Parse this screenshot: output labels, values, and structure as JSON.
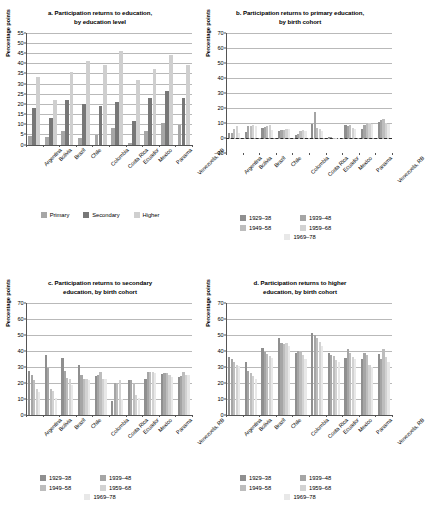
{
  "figure": {
    "ylabel": "Percentage points"
  },
  "panels": [
    {
      "id": "a",
      "title_line1": "a. Participation returns to education,",
      "title_line2": "by education level"
    },
    {
      "id": "b",
      "title_line1": "b. Participation returns to primary education,",
      "title_line2": "by birth cohort"
    },
    {
      "id": "c",
      "title_line1": "c. Participation returns to secondary",
      "title_line2": "education, by birth cohort"
    },
    {
      "id": "d",
      "title_line1": "d. Participation returns to higher",
      "title_line2": "education, by birth cohort"
    }
  ],
  "legend_education": {
    "items": [
      {
        "label": "Primary",
        "color": "#a6a6a6"
      },
      {
        "label": "Secondary",
        "color": "#777777"
      },
      {
        "label": "Higher",
        "color": "#cfcfcf"
      }
    ]
  },
  "legend_cohort": {
    "items": [
      {
        "label": "1929–38",
        "color": "#8f8f8f"
      },
      {
        "label": "1939–48",
        "color": "#a5a5a5"
      },
      {
        "label": "1949–58",
        "color": "#bdbdbd"
      },
      {
        "label": "1959–68",
        "color": "#d2d2d2"
      },
      {
        "label": "1969–78",
        "color": "#e8e8e8"
      }
    ]
  },
  "chart_data": [
    {
      "type": "bar",
      "panel": "a",
      "title": "a. Participation returns to education, by education level",
      "xlabel": "",
      "ylabel": "Percentage points",
      "ylim": [
        0,
        55
      ],
      "yticks": [
        0,
        5,
        10,
        15,
        20,
        25,
        30,
        35,
        40,
        45,
        50,
        55
      ],
      "grid": true,
      "legend_position": "bottom",
      "categories": [
        "Argentina",
        "Bolivia",
        "Brazil",
        "Chile",
        "Colombia",
        "Costa Rica",
        "Ecuador",
        "Mexico",
        "Panama",
        "Venezuela, RB"
      ],
      "series": [
        {
          "name": "Primary",
          "color": "#a6a6a6",
          "values": [
            4.3,
            3.7,
            6.8,
            3.4,
            4.8,
            8.0,
            0.8,
            6.9,
            10.6,
            9.8
          ]
        },
        {
          "name": "Secondary",
          "color": "#777777",
          "values": [
            17.8,
            13.0,
            21.8,
            20.0,
            19.2,
            20.9,
            11.8,
            23.0,
            26.3,
            23.1
          ]
        },
        {
          "name": "Higher",
          "color": "#cfcfcf",
          "values": [
            33.4,
            22.0,
            35.8,
            41.2,
            39.1,
            45.8,
            31.6,
            37.0,
            43.8,
            39.0
          ]
        }
      ]
    },
    {
      "type": "bar",
      "panel": "b",
      "title": "b. Participation returns to primary education, by birth cohort",
      "xlabel": "",
      "ylabel": "Percentage points",
      "ylim": [
        -10,
        70
      ],
      "yticks": [
        -10,
        0,
        10,
        20,
        30,
        40,
        50,
        60,
        70
      ],
      "grid": true,
      "legend_position": "bottom",
      "categories": [
        "Argentina",
        "Bolivia",
        "Brazil",
        "Chile",
        "Colombia",
        "Costa Rica",
        "Ecuador",
        "Mexico",
        "Panama",
        "Venezuela, RB"
      ],
      "series": [
        {
          "name": "1929–38",
          "color": "#8f8f8f",
          "values": [
            3.0,
            4.0,
            6.2,
            4.2,
            1.8,
            9.2,
            0.3,
            8.5,
            6.0,
            10.5
          ]
        },
        {
          "name": "1939–48",
          "color": "#a5a5a5",
          "values": [
            3.2,
            7.5,
            6.8,
            5.2,
            2.5,
            16.8,
            0.2,
            8.0,
            8.2,
            11.8
          ]
        },
        {
          "name": "1949–58",
          "color": "#bdbdbd",
          "values": [
            5.5,
            7.8,
            7.5,
            5.0,
            4.5,
            6.5,
            -0.3,
            8.2,
            9.8,
            12.2
          ]
        },
        {
          "name": "1959–68",
          "color": "#d2d2d2",
          "values": [
            7.5,
            8.5,
            8.5,
            6.0,
            4.8,
            5.5,
            -0.6,
            6.5,
            9.5,
            9.5
          ]
        },
        {
          "name": "1969–78",
          "color": "#e8e8e8",
          "values": [
            3.0,
            8.0,
            5.0,
            5.5,
            4.2,
            4.5,
            -0.2,
            5.5,
            9.0,
            9.0
          ]
        }
      ]
    },
    {
      "type": "bar",
      "panel": "c",
      "title": "c. Participation returns to secondary education, by birth cohort",
      "xlabel": "",
      "ylabel": "Percentage points",
      "ylim": [
        0,
        70
      ],
      "yticks": [
        0,
        10,
        20,
        30,
        40,
        50,
        60,
        70
      ],
      "grid": true,
      "legend_position": "bottom",
      "categories": [
        "Argentina",
        "Bolivia",
        "Brazil",
        "Chile",
        "Colombia",
        "Costa Rica",
        "Ecuador",
        "Mexico",
        "Panama",
        "Venezuela, RB"
      ],
      "series": [
        {
          "name": "1929–38",
          "color": "#8f8f8f",
          "values": [
            27.2,
            37.5,
            35.5,
            31.0,
            24.0,
            8.5,
            21.5,
            22.0,
            25.2,
            23.5
          ]
        },
        {
          "name": "1939–48",
          "color": "#a5a5a5",
          "values": [
            24.5,
            29.2,
            27.2,
            25.0,
            25.0,
            19.5,
            21.8,
            26.8,
            26.0,
            24.0
          ]
        },
        {
          "name": "1949–58",
          "color": "#bdbdbd",
          "values": [
            21.5,
            16.0,
            23.0,
            22.0,
            26.5,
            19.0,
            19.5,
            26.8,
            26.0,
            26.5
          ]
        },
        {
          "name": "1959–68",
          "color": "#d2d2d2",
          "values": [
            16.0,
            15.0,
            22.5,
            22.2,
            22.5,
            21.5,
            12.0,
            26.5,
            24.8,
            25.0
          ]
        },
        {
          "name": "1969–78",
          "color": "#e8e8e8",
          "values": [
            14.0,
            10.5,
            18.5,
            21.8,
            22.0,
            10.0,
            10.5,
            25.8,
            23.5,
            24.5
          ]
        }
      ]
    },
    {
      "type": "bar",
      "panel": "d",
      "title": "d. Participation returns to higher education, by birth cohort",
      "xlabel": "",
      "ylabel": "Percentage points",
      "ylim": [
        0,
        70
      ],
      "yticks": [
        0,
        10,
        20,
        30,
        40,
        50,
        60,
        70
      ],
      "grid": true,
      "legend_position": "bottom",
      "categories": [
        "Argentina",
        "Bolivia",
        "Brazil",
        "Chile",
        "Colombia",
        "Costa Rica",
        "Ecuador",
        "Mexico",
        "Panama",
        "Venezuela, RB"
      ],
      "series": [
        {
          "name": "1929–38",
          "color": "#8f8f8f",
          "values": [
            36.0,
            33.0,
            41.5,
            48.0,
            38.5,
            51.0,
            38.5,
            35.5,
            35.0,
            38.0
          ]
        },
        {
          "name": "1939–48",
          "color": "#a5a5a5",
          "values": [
            34.5,
            27.0,
            39.0,
            45.0,
            40.0,
            49.5,
            37.5,
            41.0,
            38.5,
            34.5
          ]
        },
        {
          "name": "1949–58",
          "color": "#bdbdbd",
          "values": [
            33.0,
            26.0,
            38.0,
            44.0,
            39.5,
            48.0,
            36.5,
            38.5,
            37.5,
            41.0
          ]
        },
        {
          "name": "1959–68",
          "color": "#d2d2d2",
          "values": [
            31.0,
            24.0,
            36.5,
            44.5,
            37.0,
            45.5,
            34.0,
            36.0,
            31.0,
            36.0
          ]
        },
        {
          "name": "1969–78",
          "color": "#e8e8e8",
          "values": [
            30.5,
            22.5,
            35.5,
            43.0,
            35.0,
            43.0,
            33.0,
            34.5,
            30.0,
            33.0
          ]
        }
      ]
    }
  ]
}
